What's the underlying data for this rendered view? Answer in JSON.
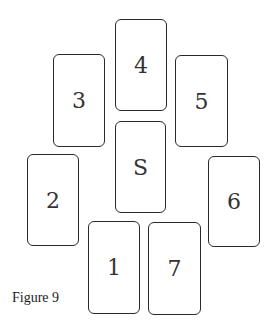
{
  "figure": {
    "caption": "Figure 9",
    "cards": [
      {
        "label": "4",
        "x": 115,
        "y": 19,
        "w": 52,
        "h": 92
      },
      {
        "label": "3",
        "x": 53,
        "y": 54,
        "w": 52,
        "h": 93
      },
      {
        "label": "5",
        "x": 175,
        "y": 55,
        "w": 53,
        "h": 92
      },
      {
        "label": "S",
        "x": 115,
        "y": 121,
        "w": 51,
        "h": 92
      },
      {
        "label": "2",
        "x": 27,
        "y": 154,
        "w": 52,
        "h": 92
      },
      {
        "label": "6",
        "x": 208,
        "y": 156,
        "w": 52,
        "h": 91
      },
      {
        "label": "1",
        "x": 88,
        "y": 221,
        "w": 52,
        "h": 93
      },
      {
        "label": "7",
        "x": 148,
        "y": 222,
        "w": 53,
        "h": 93
      }
    ]
  }
}
